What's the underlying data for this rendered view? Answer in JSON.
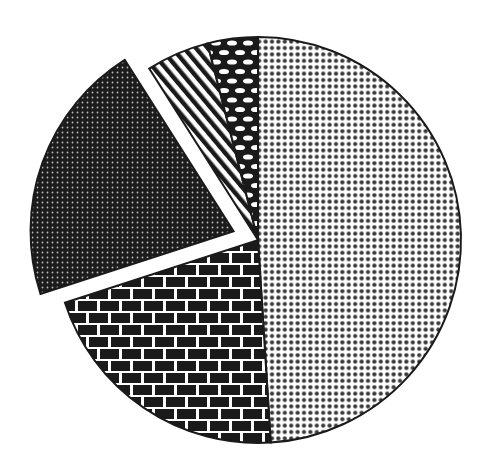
{
  "chart_data": {
    "type": "pie",
    "title": "",
    "legend": [],
    "categories": [
      "Dotted slice",
      "Brick slice",
      "Dark exploded slice",
      "Striped slice",
      "Oval pattern slice"
    ],
    "values": [
      49,
      21,
      21,
      5,
      4
    ],
    "units": "percent (estimated from angles)",
    "start_angle_deg": -90,
    "direction": "clockwise",
    "exploded": [
      false,
      false,
      true,
      false,
      false
    ],
    "patterns": [
      "fine-dots",
      "brick",
      "dark-dotted",
      "diagonal-stripes",
      "ovals"
    ],
    "colors": {
      "ink": "#1a1a1a",
      "paper": "#ffffff",
      "dot": "#3a3a3a"
    },
    "geometry": {
      "center": [
        258,
        240
      ],
      "radius": 203,
      "explode_offset": 26
    }
  }
}
